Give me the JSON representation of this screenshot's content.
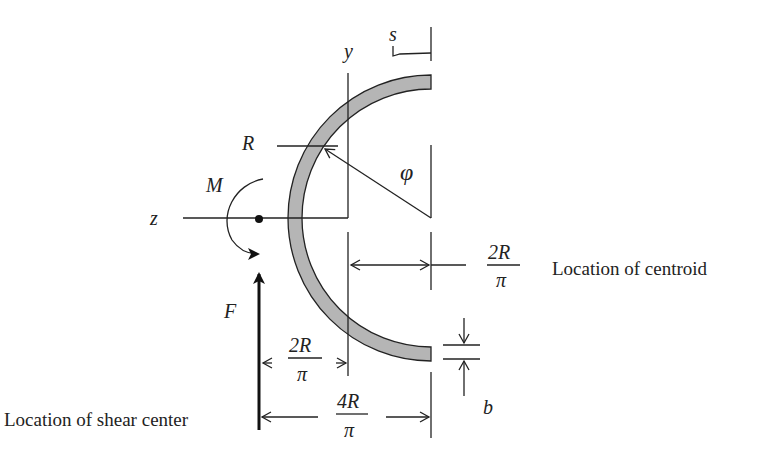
{
  "diagram": {
    "colors": {
      "section_fill": "#b5b5b5",
      "line": "#222222",
      "background": "#ffffff"
    },
    "axes": {
      "y_label": "y",
      "z_label": "z"
    },
    "labels": {
      "arc_coordinate": "s",
      "radius": "R",
      "angle": "φ",
      "moment": "M",
      "force": "F",
      "thickness": "b"
    },
    "dimensions": {
      "centroid": {
        "numerator": "2R",
        "denominator": "π",
        "caption": "Location of centroid"
      },
      "shear_center_offset": {
        "numerator": "2R",
        "denominator": "π"
      },
      "shear_center_total": {
        "numerator": "4R",
        "denominator": "π",
        "caption": "Location of shear center"
      }
    }
  }
}
